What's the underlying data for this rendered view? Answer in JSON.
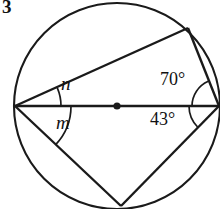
{
  "figure": {
    "problem_number": "3",
    "stroke_color": "#1a1a1a",
    "background_color": "#ffffff"
  },
  "labels": {
    "angle_n": "n",
    "angle_m": "m",
    "angle_70": "70°",
    "angle_43": "43°"
  },
  "geometry": {
    "circle": {
      "cx": 117,
      "cy": 106,
      "r": 103
    },
    "center_dot": {
      "cx": 117,
      "cy": 106,
      "r": 3.5
    },
    "points": {
      "left_vertex": {
        "x": 15,
        "y": 106
      },
      "right_vertex": {
        "x": 219,
        "y": 106
      },
      "top_right_vertex": {
        "x": 188,
        "y": 28
      },
      "bottom_vertex": {
        "x": 121,
        "y": 206
      }
    },
    "segments": [
      {
        "name": "diameter",
        "from": "left_vertex",
        "to": "right_vertex"
      },
      {
        "name": "chord-left-to-topright",
        "from": "left_vertex",
        "to": "top_right_vertex"
      },
      {
        "name": "chord-topright-to-right",
        "from": "top_right_vertex",
        "to": "right_vertex"
      },
      {
        "name": "chord-left-to-bottom",
        "from": "left_vertex",
        "to": "bottom_vertex"
      },
      {
        "name": "chord-bottom-to-right",
        "from": "bottom_vertex",
        "to": "right_vertex"
      }
    ],
    "angle_arcs": [
      {
        "name": "arc-n",
        "at": "left_vertex",
        "radius": 46
      },
      {
        "name": "arc-m",
        "at": "left_vertex",
        "radius": 56
      },
      {
        "name": "arc-70",
        "at": "right_vertex",
        "radius": 27
      },
      {
        "name": "arc-43",
        "at": "right_vertex",
        "radius": 30
      }
    ]
  }
}
